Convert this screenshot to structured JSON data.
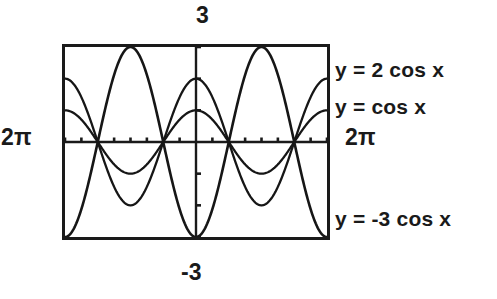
{
  "figure": {
    "title_top_label": "3",
    "title_bottom_label": "-3",
    "left_axis_label": "2π",
    "right_axis_label": "2π"
  },
  "curve_labels": {
    "two_cos": "y = 2 cos x",
    "cos": "y = cos x",
    "neg_three_cos": "y = -3 cos x"
  },
  "colors": {
    "ink": "#1a1a1a",
    "background": "#ffffff",
    "curve": "#161616"
  },
  "chart_data": {
    "type": "line",
    "title": "",
    "xlabel": "",
    "ylabel": "",
    "xlim": [
      -6.283185307179586,
      6.283185307179586
    ],
    "ylim": [
      -3,
      3
    ],
    "grid": false,
    "legend_position": "right",
    "x_tick_step": 0.7853981633974483,
    "y_tick_step": 1,
    "x_tick_values": [
      -6.283185307179586,
      -5.497787143782138,
      -4.71238898038469,
      -3.9269908169872414,
      -3.141592653589793,
      -2.356194490192345,
      -1.5707963267948966,
      -0.7853981633974483,
      0,
      0.7853981633974483,
      1.5707963267948966,
      2.356194490192345,
      3.141592653589793,
      3.9269908169872414,
      4.71238898038469,
      5.497787143782138,
      6.283185307179586
    ],
    "y_tick_values": [
      -3,
      -2,
      -1,
      0,
      1,
      2,
      3
    ],
    "axis_labels": {
      "x_min": "2π",
      "x_max": "2π",
      "y_max": "3",
      "y_min": "-3"
    },
    "series": [
      {
        "name": "y = 2 cos x",
        "amplitude": 2,
        "period": 6.283185307179586,
        "phase": 0,
        "function": "2*cos(x)",
        "key_points": [
          {
            "x": -6.283185307179586,
            "y": 2
          },
          {
            "x": -4.71238898038469,
            "y": 0
          },
          {
            "x": -3.141592653589793,
            "y": -2
          },
          {
            "x": -1.5707963267948966,
            "y": 0
          },
          {
            "x": 0,
            "y": 2
          },
          {
            "x": 1.5707963267948966,
            "y": 0
          },
          {
            "x": 3.141592653589793,
            "y": -2
          },
          {
            "x": 4.71238898038469,
            "y": 0
          },
          {
            "x": 6.283185307179586,
            "y": 2
          }
        ]
      },
      {
        "name": "y = cos x",
        "amplitude": 1,
        "period": 6.283185307179586,
        "phase": 0,
        "function": "cos(x)",
        "key_points": [
          {
            "x": -6.283185307179586,
            "y": 1
          },
          {
            "x": -4.71238898038469,
            "y": 0
          },
          {
            "x": -3.141592653589793,
            "y": -1
          },
          {
            "x": -1.5707963267948966,
            "y": 0
          },
          {
            "x": 0,
            "y": 1
          },
          {
            "x": 1.5707963267948966,
            "y": 0
          },
          {
            "x": 3.141592653589793,
            "y": -1
          },
          {
            "x": 4.71238898038469,
            "y": 0
          },
          {
            "x": 6.283185307179586,
            "y": 1
          }
        ]
      },
      {
        "name": "y = -3 cos x",
        "amplitude": -3,
        "period": 6.283185307179586,
        "phase": 0,
        "function": "-3*cos(x)",
        "key_points": [
          {
            "x": -6.283185307179586,
            "y": -3
          },
          {
            "x": -4.71238898038469,
            "y": 0
          },
          {
            "x": -3.141592653589793,
            "y": 3
          },
          {
            "x": -1.5707963267948966,
            "y": 0
          },
          {
            "x": 0,
            "y": -3
          },
          {
            "x": 1.5707963267948966,
            "y": 0
          },
          {
            "x": 3.141592653589793,
            "y": 3
          },
          {
            "x": 4.71238898038469,
            "y": 0
          },
          {
            "x": 6.283185307179586,
            "y": -3
          }
        ]
      }
    ]
  }
}
